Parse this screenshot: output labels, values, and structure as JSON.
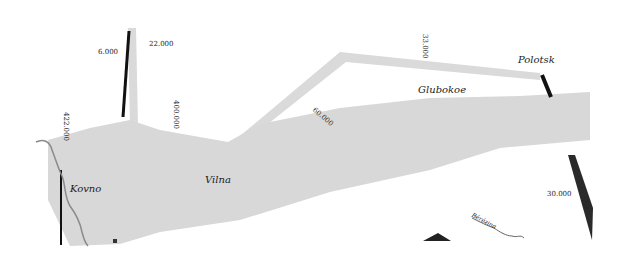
{
  "map": {
    "colors": {
      "advance": "#d9d9d9",
      "retreat": "#1a1a1a",
      "river": "#8a8a8a",
      "background": "#ffffff"
    },
    "cities": [
      {
        "name": "Kovno"
      },
      {
        "name": "Vilna"
      },
      {
        "name": "Glubokoe"
      },
      {
        "name": "Polotsk"
      }
    ],
    "troop_labels": [
      {
        "value": "6.000"
      },
      {
        "value": "22.000"
      },
      {
        "value": "422.000"
      },
      {
        "value": "400.000"
      },
      {
        "value": "60.000"
      },
      {
        "value": "33.000"
      },
      {
        "value": "30.000"
      }
    ],
    "rivers": [
      {
        "name": "Bérézina"
      }
    ]
  }
}
